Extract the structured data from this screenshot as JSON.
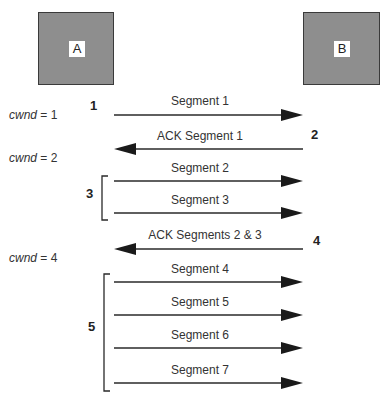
{
  "hosts": [
    {
      "id": "A",
      "label": "A"
    },
    {
      "id": "B",
      "label": "B"
    }
  ],
  "cwnd_labels": [
    {
      "var": "cwnd",
      "text": " = 1"
    },
    {
      "var": "cwnd",
      "text": " = 2"
    },
    {
      "var": "cwnd",
      "text": " = 4"
    }
  ],
  "steps": [
    "1",
    "2",
    "3",
    "4",
    "5"
  ],
  "messages": [
    {
      "label": "Segment 1",
      "direction": "A→B"
    },
    {
      "label": "ACK Segment 1",
      "direction": "B→A"
    },
    {
      "label": "Segment 2",
      "direction": "A→B"
    },
    {
      "label": "Segment 3",
      "direction": "A→B"
    },
    {
      "label": "ACK Segments 2 & 3",
      "direction": "B→A"
    },
    {
      "label": "Segment 4",
      "direction": "A→B"
    },
    {
      "label": "Segment 5",
      "direction": "A→B"
    },
    {
      "label": "Segment 6",
      "direction": "A→B"
    },
    {
      "label": "Segment 7",
      "direction": "A→B"
    }
  ],
  "colors": {
    "host_fill": "#8e8e8e",
    "line": "#2a2a2a"
  }
}
